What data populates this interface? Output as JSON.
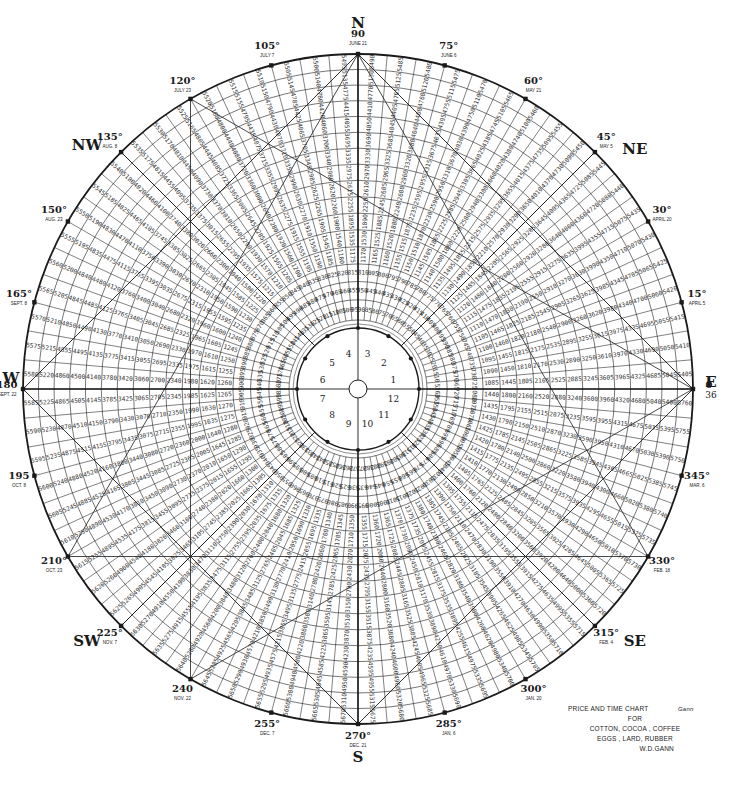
{
  "caption": {
    "line1": "PRICE AND TIME CHART",
    "line2": "FOR",
    "line3": "COTTON, COCOA , COFFEE",
    "line4": "EGGS , LARD, RUBBER",
    "line5": "W.D.GANN",
    "signature": "Gann"
  },
  "colors": {
    "ink": "#1a1a1a",
    "paper": "#ffffff"
  },
  "geometry": {
    "cx": 358,
    "cy": 389,
    "outer_r": 335,
    "inner_r": 61,
    "rings": 16,
    "spokes": 72,
    "hub_r": 9
  },
  "compass": [
    {
      "dir": "N",
      "deg": 90
    },
    {
      "dir": "NE",
      "deg": 45
    },
    {
      "dir": "E",
      "deg": 0
    },
    {
      "dir": "SE",
      "deg": 315
    },
    {
      "dir": "S",
      "deg": 270
    },
    {
      "dir": "SW",
      "deg": 225
    },
    {
      "dir": "W",
      "deg": 180
    },
    {
      "dir": "NW",
      "deg": 135
    }
  ],
  "degree_markers": [
    {
      "deg": 0,
      "label": "0",
      "sub": "36",
      "date": ""
    },
    {
      "deg": 15,
      "label": "15°",
      "date": "APRIL 5"
    },
    {
      "deg": 30,
      "label": "30°",
      "date": "APRIL 20"
    },
    {
      "deg": 45,
      "label": "45°",
      "date": "MAY 5"
    },
    {
      "deg": 60,
      "label": "60°",
      "date": "MAY 21"
    },
    {
      "deg": 75,
      "label": "75°",
      "date": "JUNE 6"
    },
    {
      "deg": 90,
      "label": "90",
      "date": "JUNE 21"
    },
    {
      "deg": 105,
      "label": "105°",
      "date": "JULY 7"
    },
    {
      "deg": 120,
      "label": "120°",
      "date": "JULY 23"
    },
    {
      "deg": 135,
      "label": "135°",
      "date": "AUG. 8"
    },
    {
      "deg": 150,
      "label": "150°",
      "date": "AUG. 23"
    },
    {
      "deg": 165,
      "label": "165°",
      "date": "SEPT. 8"
    },
    {
      "deg": 180,
      "label": "180",
      "date": "SEPT. 22"
    },
    {
      "deg": 195,
      "label": "195",
      "date": "OCT. 8"
    },
    {
      "deg": 210,
      "label": "210°",
      "date": "OCT. 23"
    },
    {
      "deg": 225,
      "label": "225°",
      "date": "NOV. 7"
    },
    {
      "deg": 240,
      "label": "240",
      "date": "NOV. 22"
    },
    {
      "deg": 255,
      "label": "255°",
      "date": "DEC. 7"
    },
    {
      "deg": 270,
      "label": "270°",
      "date": "DEC. 21"
    },
    {
      "deg": 285,
      "label": "285°",
      "date": "JAN. 6"
    },
    {
      "deg": 300,
      "label": "300°",
      "date": "JAN. 20"
    },
    {
      "deg": 315,
      "label": "315°",
      "date": "FEB. 4"
    },
    {
      "deg": 330,
      "label": "330°",
      "date": "FEB. 18"
    },
    {
      "deg": 345,
      "label": "345°",
      "date": "MAR. 6"
    }
  ],
  "inner_sectors": [
    "1",
    "2",
    "3",
    "4",
    "5",
    "6",
    "7",
    "8",
    "9",
    "10",
    "11",
    "12"
  ],
  "chart_data": {
    "type": "table",
    "layout": "circular square-of-nine style price/time wheel",
    "angular_divisions": 72,
    "degrees_per_division": 5,
    "ring_count": 16,
    "outer_ring_sample_values": {
      "east_0deg": [
        5400,
        5405,
        5410,
        5415,
        5420,
        5425,
        5430,
        5435,
        5440,
        5445
      ],
      "north_90deg": [
        5460,
        5465,
        5470,
        5475,
        5480,
        5485
      ],
      "west_180deg": [
        5560,
        5565,
        5570,
        5575,
        5580,
        5585,
        5590,
        5595
      ],
      "south_270deg": [
        5640,
        5645,
        5650,
        5655,
        5660,
        5665,
        5670
      ],
      "southeast": [
        5700,
        5705,
        5710,
        5715,
        5720,
        5725,
        5730,
        5735,
        5740,
        5745,
        5750
      ]
    },
    "east_axis_row_values": [
      715,
      1115,
      1480,
      1800,
      2160,
      2520,
      2880,
      3240,
      3600,
      3960,
      4320,
      4680,
      5040,
      5400
    ],
    "west_axis_row_values": [
      900,
      1260,
      1620,
      1980,
      2340,
      2700,
      3060,
      3420,
      3780,
      4140,
      4500,
      4860,
      5220,
      5580
    ],
    "north_axis_column_values": [
      1170,
      1530,
      1890,
      2250,
      2610,
      2970,
      3330,
      3690,
      4050,
      4410,
      4770,
      5130,
      5490
    ],
    "step_per_ring": 360,
    "step_per_division": 5
  }
}
